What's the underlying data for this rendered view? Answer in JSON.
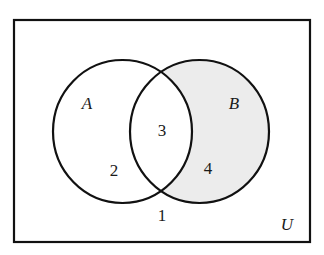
{
  "diagram": {
    "type": "venn",
    "universe_label": "U",
    "sets": [
      {
        "name": "A",
        "label": "A"
      },
      {
        "name": "B",
        "label": "B"
      }
    ],
    "regions": [
      {
        "id": "A-only",
        "label": "2",
        "shaded": false
      },
      {
        "id": "A-and-B",
        "label": "3",
        "shaded": false
      },
      {
        "id": "B-only",
        "label": "4",
        "shaded": true
      },
      {
        "id": "outside",
        "label": "1",
        "shaded": false
      }
    ],
    "shaded_region": "B minus A",
    "colors": {
      "stroke": "#111111",
      "shade": "#ececec",
      "background": "#ffffff"
    }
  }
}
